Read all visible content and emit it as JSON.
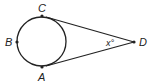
{
  "diagram": {
    "type": "circle-with-two-tangents",
    "points": {
      "A": {
        "label": "A"
      },
      "B": {
        "label": "B"
      },
      "C": {
        "label": "C"
      },
      "D": {
        "label": "D"
      }
    },
    "angle_label": "x°",
    "colors": {
      "stroke": "#222222",
      "background": "#ffffff"
    }
  }
}
